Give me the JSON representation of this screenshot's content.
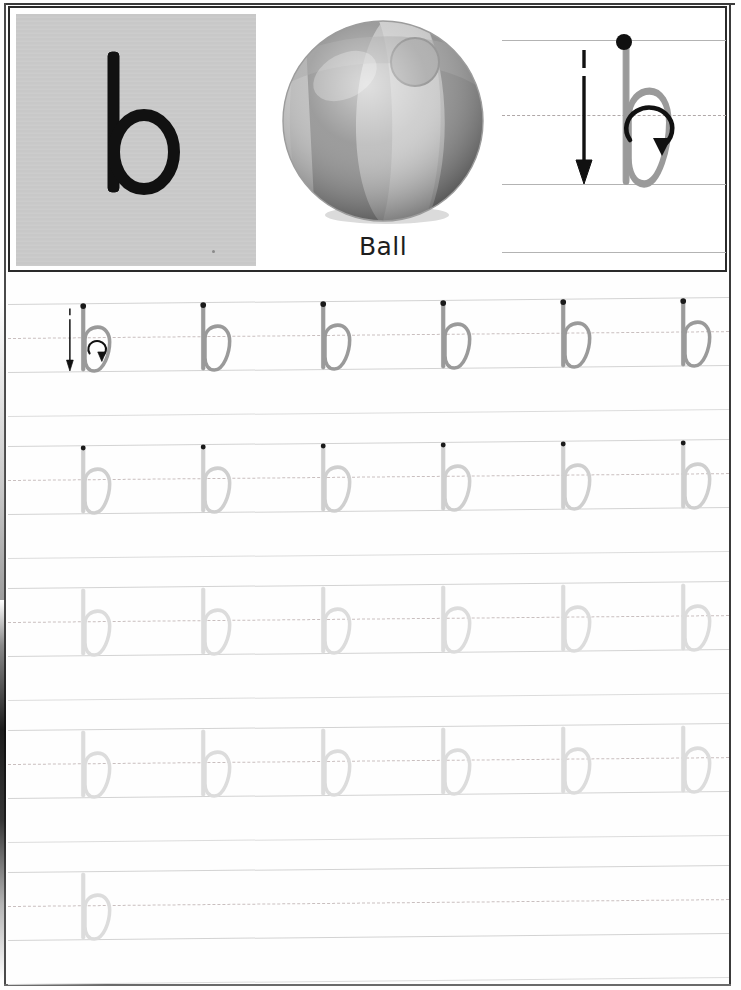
{
  "worksheet": {
    "letter": "b",
    "letter_case": "lowercase",
    "picture_word": "Ball",
    "picture_icon": "beach-ball-image",
    "model_icon": "letter-b-stroke-order",
    "start_dot_color": "#1a1a1a",
    "trace_letter_color": "#9a9a9a",
    "trace_letter_faint_color": "#d7d7d7",
    "arrow_color": "#111111",
    "card_background": "#c9c9c9",
    "rule_color": "#d3d3d3",
    "midline_color": "#c9bfbf"
  },
  "header": {
    "model_letter_label": "b",
    "caption": "Ball",
    "stroke_hints": [
      "stroke-1-down-arrow",
      "stroke-2-circle-arrow"
    ]
  },
  "practice_rows": [
    {
      "index": 1,
      "top": 8,
      "line_top": 28,
      "line_mid": 62,
      "line_base": 96,
      "separator": 140,
      "style": "guided",
      "letter_color": "#9a9a9a",
      "show_dots": true,
      "show_arrows_on_first": true,
      "count": 6,
      "letters": [
        "b",
        "b",
        "b",
        "b",
        "b",
        "b"
      ]
    },
    {
      "index": 2,
      "top": 150,
      "line_top": 170,
      "line_mid": 204,
      "line_base": 238,
      "separator": 282,
      "style": "dotted",
      "letter_color": "#cfcfcf",
      "show_dots": true,
      "show_arrows_on_first": false,
      "count": 6,
      "letters": [
        "b",
        "b",
        "b",
        "b",
        "b",
        "b"
      ]
    },
    {
      "index": 3,
      "top": 292,
      "line_top": 312,
      "line_mid": 346,
      "line_base": 380,
      "separator": 424,
      "style": "faint",
      "letter_color": "#dcdcdc",
      "show_dots": false,
      "show_arrows_on_first": false,
      "count": 6,
      "letters": [
        "b",
        "b",
        "b",
        "b",
        "b",
        "b"
      ]
    },
    {
      "index": 4,
      "top": 434,
      "line_top": 454,
      "line_mid": 488,
      "line_base": 522,
      "separator": 566,
      "style": "faint",
      "letter_color": "#dcdcdc",
      "show_dots": false,
      "show_arrows_on_first": false,
      "count": 6,
      "letters": [
        "b",
        "b",
        "b",
        "b",
        "b",
        "b"
      ]
    },
    {
      "index": 5,
      "top": 576,
      "line_top": 596,
      "line_mid": 630,
      "line_base": 664,
      "separator": 708,
      "style": "free",
      "letter_color": "#dcdcdc",
      "show_dots": false,
      "show_arrows_on_first": false,
      "count": 1,
      "letters": [
        "b"
      ]
    }
  ],
  "layout": {
    "glyph_start_x": 56,
    "glyph_spacing": 120,
    "glyph_width": 58,
    "row_skew_px": 8
  }
}
